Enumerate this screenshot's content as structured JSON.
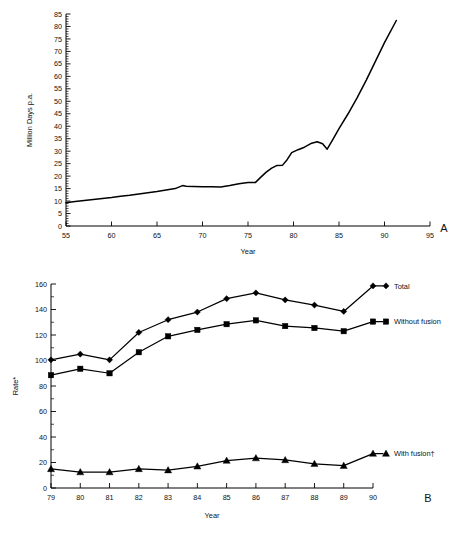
{
  "figure": {
    "panel_a_letter": "A",
    "panel_b_letter": "B"
  },
  "chart_data": [
    {
      "id": "panel-a",
      "type": "line",
      "title": "",
      "xlabel": "Year",
      "ylabel": "Million Days p.a.",
      "xlim": [
        55,
        95
      ],
      "ylim": [
        0,
        85
      ],
      "xticks": [
        55,
        60,
        65,
        70,
        75,
        80,
        85,
        90,
        95
      ],
      "yticks": [
        0,
        5,
        10,
        15,
        20,
        25,
        30,
        35,
        40,
        45,
        50,
        55,
        60,
        65,
        70,
        75,
        80,
        85
      ],
      "ytick_labels": [
        "0",
        "5",
        "10",
        "15",
        "20",
        "25",
        "30",
        "35",
        "40",
        "45",
        "50",
        "55",
        "60",
        "65",
        "70",
        "75",
        "80",
        "85"
      ],
      "xtick_labels": [
        "55",
        "60",
        "65",
        "70",
        "75",
        "80",
        "85",
        "90",
        "95"
      ],
      "minor_tick_interval_y": 1,
      "grid": false,
      "legend": "none",
      "series": [
        {
          "name": "Million Days p.a.",
          "x": [
            55,
            56,
            57,
            58,
            59,
            60,
            61,
            62,
            63,
            64,
            65,
            66,
            67,
            67.8,
            68.2,
            69,
            70,
            71,
            72,
            73,
            74,
            75,
            75.8,
            76.3,
            77,
            77.6,
            78.2,
            78.8,
            79.3,
            79.8,
            80.5,
            81.2,
            82,
            82.6,
            83.2,
            83.7,
            84.3,
            85,
            86,
            87,
            88,
            89,
            90,
            91.3
          ],
          "y": [
            9.3,
            9.8,
            10.2,
            10.6,
            11.0,
            11.4,
            11.9,
            12.3,
            12.8,
            13.3,
            13.8,
            14.4,
            15.0,
            16.2,
            15.9,
            15.8,
            15.7,
            15.7,
            15.6,
            16.2,
            16.9,
            17.4,
            17.4,
            19.2,
            21.6,
            23.2,
            24.3,
            24.4,
            26.6,
            29.4,
            30.6,
            31.6,
            33.2,
            33.8,
            33.0,
            30.8,
            34.5,
            39.0,
            45.0,
            51.5,
            58.5,
            66.0,
            73.5,
            82.4
          ]
        }
      ]
    },
    {
      "id": "panel-b",
      "type": "line",
      "title": "",
      "xlabel": "Year",
      "ylabel": "Rate*",
      "xlim": [
        79,
        90
      ],
      "ylim": [
        0,
        160
      ],
      "xticks": [
        79,
        80,
        81,
        82,
        83,
        84,
        85,
        86,
        87,
        88,
        89,
        90
      ],
      "xtick_labels": [
        "79",
        "80",
        "81",
        "82",
        "83",
        "84",
        "85",
        "86",
        "87",
        "88",
        "89",
        "90"
      ],
      "yticks": [
        0,
        20,
        40,
        60,
        80,
        100,
        120,
        140,
        160
      ],
      "ytick_labels": [
        "0",
        "20",
        "40",
        "60",
        "80",
        "100",
        "120",
        "140",
        "160"
      ],
      "minor_tick_interval_y": 10,
      "grid": false,
      "legend": "right-inline",
      "categories": [
        79,
        80,
        81,
        82,
        83,
        84,
        85,
        86,
        87,
        88,
        89,
        90
      ],
      "series": [
        {
          "name": "Total",
          "marker": "diamond",
          "values": [
            100.5,
            105.0,
            100.5,
            122.0,
            132.0,
            138.0,
            148.5,
            153.0,
            147.5,
            143.5,
            138.5,
            158.5
          ]
        },
        {
          "name": "Without fusion",
          "marker": "square",
          "values": [
            88.5,
            93.5,
            90.0,
            106.5,
            119.0,
            124.0,
            128.5,
            131.5,
            127.0,
            125.5,
            123.0,
            130.5
          ]
        },
        {
          "name": "With fusion†",
          "marker": "triangle",
          "values": [
            15.0,
            12.5,
            12.5,
            15.0,
            14.0,
            17.0,
            21.5,
            23.5,
            22.0,
            19.0,
            17.5,
            27.0
          ]
        }
      ]
    }
  ]
}
